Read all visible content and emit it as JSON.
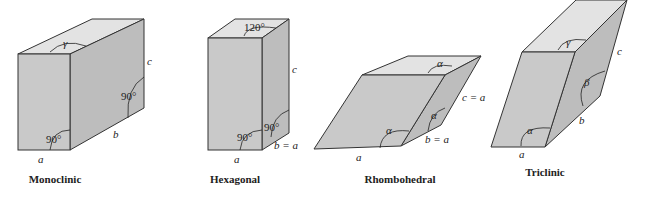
{
  "diagrams": [
    {
      "name": "Monoclinic",
      "labels": {
        "top_angle": "γ",
        "edge_c": "c",
        "side_angle": "90°",
        "front_angle": "90°",
        "edge_b": "b",
        "edge_a": "a"
      }
    },
    {
      "name": "Hexagonal",
      "labels": {
        "top_angle": "120°",
        "edge_c": "c",
        "side_angle": "90°",
        "front_angle": "90°",
        "edge_b": "b = a",
        "edge_a": "a"
      }
    },
    {
      "name": "Rhombohedral",
      "labels": {
        "top_angle": "α",
        "edge_c": "c = a",
        "side_angle": "α",
        "front_angle": "α",
        "edge_b": "b = a",
        "edge_a": "a"
      }
    },
    {
      "name": "Triclinic",
      "labels": {
        "top_angle": "γ",
        "edge_c": "c",
        "side_angle": "β",
        "front_angle": "α",
        "edge_b": "b",
        "edge_a": "a"
      }
    }
  ],
  "colors": {
    "front": "#c9c9c9",
    "side": "#bdbdbd",
    "top": "#e3e3e3",
    "stroke": "#333333"
  }
}
